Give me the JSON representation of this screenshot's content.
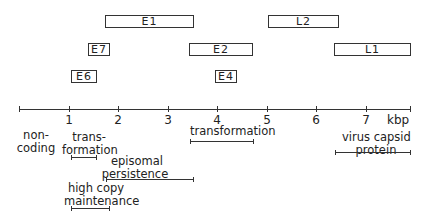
{
  "diagram": {
    "type": "genome map",
    "axis": {
      "unit_label": "kbp",
      "range": [
        0,
        7.9
      ],
      "ticks": [
        {
          "value": 0,
          "label": ""
        },
        {
          "value": 1,
          "label": "1"
        },
        {
          "value": 2,
          "label": "2"
        },
        {
          "value": 3,
          "label": "3"
        },
        {
          "value": 4,
          "label": "4"
        },
        {
          "value": 5,
          "label": "5"
        },
        {
          "value": 6,
          "label": "6"
        },
        {
          "value": 7,
          "label": "7"
        }
      ]
    },
    "genes": [
      {
        "name": "E1",
        "start_kbp": 1.74,
        "end_kbp": 3.51
      },
      {
        "name": "L2",
        "start_kbp": 5.03,
        "end_kbp": 6.43
      },
      {
        "name": "E7",
        "start_kbp": 1.39,
        "end_kbp": 1.81
      },
      {
        "name": "E2",
        "start_kbp": 3.43,
        "end_kbp": 4.7
      },
      {
        "name": "L1",
        "start_kbp": 6.35,
        "end_kbp": 7.88
      },
      {
        "name": "E6",
        "start_kbp": 1.05,
        "end_kbp": 1.55
      },
      {
        "name": "E4",
        "start_kbp": 3.96,
        "end_kbp": 4.38
      }
    ],
    "functions": [
      {
        "label_line1": "non-",
        "label_line2": "coding",
        "start_kbp": null,
        "end_kbp": null
      },
      {
        "label_line1": "trans-",
        "label_line2": "formation",
        "start_kbp": 1.05,
        "end_kbp": 1.57
      },
      {
        "label_line1": "episomal",
        "label_line2": "persistence",
        "start_kbp": 1.77,
        "end_kbp": 3.53
      },
      {
        "label_line1": "high copy",
        "label_line2": "maintenance",
        "start_kbp": 1.05,
        "end_kbp": 1.83
      },
      {
        "label_line1": "transformation",
        "label_line2": "",
        "start_kbp": 3.45,
        "end_kbp": 4.73
      },
      {
        "label_line1": "virus capsid",
        "label_line2": "protein",
        "start_kbp": 6.35,
        "end_kbp": 7.88
      }
    ]
  }
}
